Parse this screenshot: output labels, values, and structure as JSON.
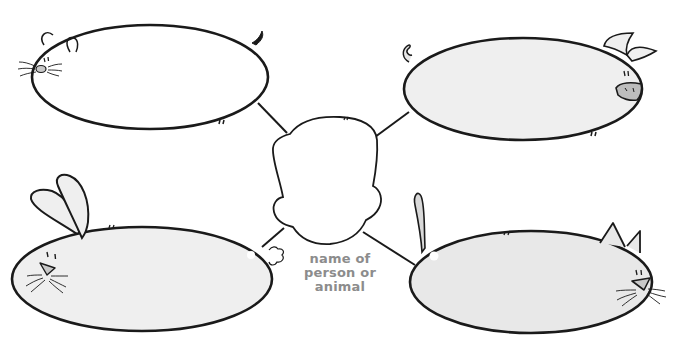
{
  "diagram": {
    "type": "web-organizer",
    "center": {
      "shape": "head-outline",
      "label_lines": [
        "name of",
        "person or",
        "animal"
      ]
    },
    "nodes": [
      {
        "id": "mouse",
        "animal": "mouse",
        "position": "top-left",
        "fill": "#ffffff"
      },
      {
        "id": "pig",
        "animal": "pig",
        "position": "top-right",
        "fill": "#efefef"
      },
      {
        "id": "rabbit",
        "animal": "rabbit",
        "position": "bottom-left",
        "fill": "#efefef"
      },
      {
        "id": "cat",
        "animal": "cat",
        "position": "bottom-right",
        "fill": "#e8e8e8"
      }
    ]
  },
  "colors": {
    "stroke": "#1a1a1a",
    "label": "#8c8c8c",
    "shade": "#c9c9c9",
    "background": "#ffffff"
  }
}
